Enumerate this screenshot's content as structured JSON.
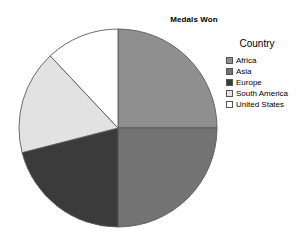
{
  "chart_data": {
    "type": "pie",
    "title": "Medals Won",
    "legend_title": "Country",
    "legend_position": "right",
    "grid": false,
    "xlabel": "",
    "ylabel": "",
    "start_angle_deg": 0,
    "direction": "clockwise",
    "categories": [
      "Africa",
      "Asia",
      "Europe",
      "South America",
      "United States"
    ],
    "values": [
      25,
      25,
      21,
      17,
      12
    ],
    "percentages": [
      25,
      25,
      21,
      17,
      12
    ],
    "slice_angles_deg": [
      90,
      90,
      75.6,
      61.2,
      43.2
    ],
    "colors": [
      "#8f8f8f",
      "#737373",
      "#3b3b3b",
      "#e2e2e2",
      "#ffffff"
    ],
    "geometry": {
      "center_x": 118,
      "center_y": 128,
      "radius": 99
    },
    "slices": [
      {
        "label": "Africa",
        "value": 25,
        "percent": 25,
        "color": "#8f8f8f",
        "start_deg": 0,
        "end_deg": 90
      },
      {
        "label": "Asia",
        "value": 25,
        "percent": 25,
        "color": "#737373",
        "start_deg": 90,
        "end_deg": 180
      },
      {
        "label": "Europe",
        "value": 21,
        "percent": 21,
        "color": "#3b3b3b",
        "start_deg": 180,
        "end_deg": 255.6
      },
      {
        "label": "South America",
        "value": 17,
        "percent": 17,
        "color": "#e2e2e2",
        "start_deg": 255.6,
        "end_deg": 316.8
      },
      {
        "label": "United States",
        "value": 12,
        "percent": 12,
        "color": "#ffffff",
        "start_deg": 316.8,
        "end_deg": 360
      }
    ],
    "stroke_color": "#5a5a5a"
  },
  "legend": {
    "title": "Country",
    "items": [
      {
        "label": "Africa",
        "color": "#8f8f8f"
      },
      {
        "label": "Asia",
        "color": "#737373"
      },
      {
        "label": "Europe",
        "color": "#3b3b3b"
      },
      {
        "label": "South America",
        "color": "#e2e2e2"
      },
      {
        "label": "United States",
        "color": "#ffffff"
      }
    ]
  }
}
